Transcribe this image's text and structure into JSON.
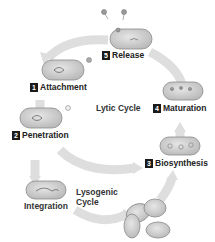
{
  "steps": [
    {
      "number": "1",
      "label": "Attachment"
    },
    {
      "number": "2",
      "label": "Penetration"
    },
    {
      "number": "3",
      "label": "Biosynthesis"
    },
    {
      "number": "4",
      "label": "Maturation"
    },
    {
      "number": "5",
      "label": "Release"
    }
  ],
  "cycles": {
    "lytic": "Lytic Cycle",
    "lysogenic_line1": "Lysogenic",
    "lysogenic_line2": "Cycle"
  },
  "integration_label": "Integration",
  "colors": {
    "arrow": "#d9d9d9",
    "cell_fill": "#c9c9c9",
    "cell_stroke": "#8a8a8a",
    "label_box": "#1a1a1a"
  }
}
